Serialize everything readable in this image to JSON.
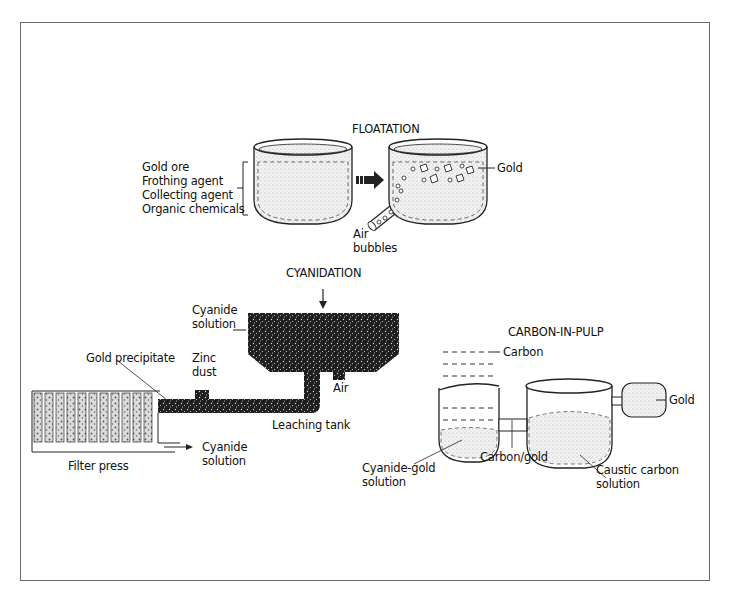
{
  "floatation": {
    "title": "FLOATATION",
    "inputs": [
      "Gold ore",
      "Frothing agent",
      "Collecting agent",
      "Organic chemicals"
    ],
    "gold_label": "Gold",
    "air_label_1": "Air",
    "air_label_2": "bubbles"
  },
  "cyanidation": {
    "title": "CYANIDATION",
    "cyanide_solution_1": "Cyanide",
    "cyanide_solution_2": "solution",
    "gold_precipitate": "Gold precipitate",
    "zinc_dust_1": "Zinc",
    "zinc_dust_2": "dust",
    "air": "Air",
    "leaching_tank": "Leaching tank",
    "filter_press": "Filter press",
    "cyanide_out_1": "Cyanide",
    "cyanide_out_2": "solution"
  },
  "carbon_in_pulp": {
    "title": "CARBON-IN-PULP",
    "carbon": "Carbon",
    "gold": "Gold",
    "cyanide_gold_1": "Cyanide-gold",
    "cyanide_gold_2": "solution",
    "carbon_gold": "Carbon/gold",
    "caustic_1": "Caustic carbon",
    "caustic_2": "solution"
  },
  "colors": {
    "line": "#222222",
    "dark_fill": "#1e1e1e",
    "stipple": "#e6e6e6",
    "frame": "#6a6a6a"
  }
}
